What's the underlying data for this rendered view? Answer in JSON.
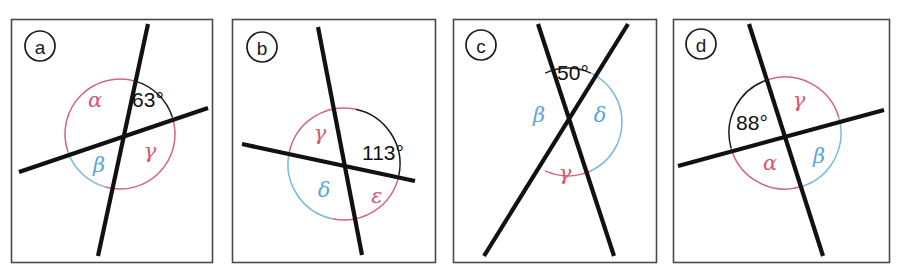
{
  "figure": {
    "background": "#ffffff",
    "width": 901,
    "height": 270,
    "colors": {
      "line": "#111111",
      "frame": "#4a4a4a",
      "arc_black": "#1a1a1a",
      "arc_red": "#d4647f",
      "arc_blue": "#7bb8e0",
      "greek_red": "#d4566e",
      "greek_blue": "#5aa5dc"
    }
  },
  "panels": [
    {
      "id": "panel-a",
      "badge": "a",
      "frame": {
        "x": 11,
        "y": 19,
        "w": 201,
        "h": 243
      },
      "badge_pos": {
        "x": 40,
        "y": 46,
        "r": 15
      },
      "center": {
        "x": 120,
        "y": 134
      },
      "angle": {
        "value": "63",
        "unit": "°",
        "text": "63°",
        "x": 148,
        "y": 99
      },
      "lines": [
        {
          "name": "steep-line",
          "x1": 148,
          "y1": 24,
          "x2": 98,
          "y2": 256
        },
        {
          "name": "shallow-line",
          "x1": 19,
          "y1": 172,
          "x2": 208,
          "y2": 108
        }
      ],
      "arcs": [
        {
          "name": "arc-63",
          "color": "black",
          "r": 55,
          "a1": -73,
          "a2": -18
        },
        {
          "name": "arc-alpha",
          "color": "red",
          "r": 55,
          "a1": 162,
          "a2": 287
        },
        {
          "name": "arc-beta",
          "color": "blue",
          "r": 55,
          "a1": 106,
          "a2": 162
        },
        {
          "name": "arc-gamma",
          "color": "red",
          "r": 55,
          "a1": -18,
          "a2": 106
        }
      ],
      "labels": [
        {
          "name": "label-alpha",
          "glyph": "α",
          "color": "red",
          "x": 95,
          "y": 100
        },
        {
          "name": "label-beta",
          "glyph": "β",
          "color": "blue",
          "x": 99,
          "y": 165
        },
        {
          "name": "label-gamma",
          "glyph": "γ",
          "color": "red",
          "x": 150,
          "y": 151
        }
      ]
    },
    {
      "id": "panel-b",
      "badge": "b",
      "frame": {
        "x": 232,
        "y": 19,
        "w": 203,
        "h": 243
      },
      "badge_pos": {
        "x": 262,
        "y": 47,
        "r": 15
      },
      "center": {
        "x": 344,
        "y": 164
      },
      "angle": {
        "value": "113",
        "unit": "°",
        "text": "113°",
        "x": 383,
        "y": 152
      },
      "lines": [
        {
          "name": "steep-line",
          "x1": 318,
          "y1": 27,
          "x2": 362,
          "y2": 255
        },
        {
          "name": "shallow-line",
          "x1": 242,
          "y1": 144,
          "x2": 415,
          "y2": 181
        }
      ],
      "arcs": [
        {
          "name": "arc-113",
          "color": "black",
          "r": 56,
          "a1": -78,
          "a2": 12
        },
        {
          "name": "arc-gamma",
          "color": "red",
          "r": 56,
          "a1": 192,
          "a2": 282
        },
        {
          "name": "arc-delta",
          "color": "blue",
          "r": 56,
          "a1": 102,
          "a2": 192
        },
        {
          "name": "arc-epsilon",
          "color": "red",
          "r": 56,
          "a1": 12,
          "a2": 102
        }
      ],
      "labels": [
        {
          "name": "label-gamma",
          "glyph": "γ",
          "color": "red",
          "x": 320,
          "y": 133
        },
        {
          "name": "label-delta",
          "glyph": "δ",
          "color": "blue",
          "x": 324,
          "y": 190
        },
        {
          "name": "label-epsilon",
          "glyph": "ε",
          "color": "red",
          "x": 377,
          "y": 196
        }
      ]
    },
    {
      "id": "panel-c",
      "badge": "c",
      "frame": {
        "x": 453,
        "y": 19,
        "w": 203,
        "h": 243
      },
      "badge_pos": {
        "x": 481,
        "y": 45,
        "r": 15
      },
      "center": {
        "x": 568,
        "y": 122
      },
      "angle": {
        "value": "50",
        "unit": "°",
        "text": "50°",
        "x": 573,
        "y": 72
      },
      "lines": [
        {
          "name": "left-line",
          "x1": 538,
          "y1": 24,
          "x2": 614,
          "y2": 256
        },
        {
          "name": "right-line",
          "x1": 628,
          "y1": 24,
          "x2": 484,
          "y2": 256
        }
      ],
      "arcs": [
        {
          "name": "arc-50",
          "color": "black",
          "r": 54,
          "a1": -115,
          "a2": -65
        },
        {
          "name": "arc-beta-delta",
          "color": "blue",
          "r": 54,
          "a1": -65,
          "a2": 65
        },
        {
          "name": "arc-gamma",
          "color": "red",
          "r": 54,
          "a1": 65,
          "a2": 115
        }
      ],
      "labels": [
        {
          "name": "label-beta",
          "glyph": "β",
          "color": "blue",
          "x": 539,
          "y": 115
        },
        {
          "name": "label-delta",
          "glyph": "δ",
          "color": "blue",
          "x": 600,
          "y": 115
        },
        {
          "name": "label-gamma",
          "glyph": "γ",
          "color": "red",
          "x": 565,
          "y": 173
        }
      ]
    },
    {
      "id": "panel-d",
      "badge": "d",
      "frame": {
        "x": 673,
        "y": 19,
        "w": 216,
        "h": 243
      },
      "badge_pos": {
        "x": 701,
        "y": 44,
        "r": 15
      },
      "center": {
        "x": 785,
        "y": 133
      },
      "angle": {
        "value": "88",
        "unit": "°",
        "text": "88°",
        "x": 752,
        "y": 122
      },
      "lines": [
        {
          "name": "steep-line",
          "x1": 749,
          "y1": 24,
          "x2": 823,
          "y2": 256
        },
        {
          "name": "shallow-line",
          "x1": 678,
          "y1": 166,
          "x2": 884,
          "y2": 110
        }
      ],
      "arcs": [
        {
          "name": "arc-88",
          "color": "black",
          "r": 56,
          "a1": 164,
          "a2": 252
        },
        {
          "name": "arc-gamma",
          "color": "red",
          "r": 56,
          "a1": 252,
          "a2": 344
        },
        {
          "name": "arc-beta",
          "color": "blue",
          "r": 56,
          "a1": 344,
          "a2": 432
        },
        {
          "name": "arc-alpha",
          "color": "red",
          "r": 56,
          "a1": 72,
          "a2": 164
        }
      ],
      "labels": [
        {
          "name": "label-gamma",
          "glyph": "γ",
          "color": "red",
          "x": 799,
          "y": 100
        },
        {
          "name": "label-alpha",
          "glyph": "α",
          "color": "red",
          "x": 770,
          "y": 163
        },
        {
          "name": "label-beta",
          "glyph": "β",
          "color": "blue",
          "x": 819,
          "y": 156
        }
      ]
    }
  ]
}
